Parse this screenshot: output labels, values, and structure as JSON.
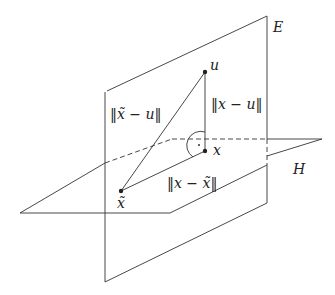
{
  "diagram": {
    "type": "geometry-projection",
    "planes": [
      {
        "id": "E",
        "label": "E"
      },
      {
        "id": "H",
        "label": "H"
      }
    ],
    "points": [
      {
        "id": "u",
        "label": "u"
      },
      {
        "id": "x",
        "label": "x"
      },
      {
        "id": "x_tilde",
        "label": "x̃"
      }
    ],
    "segments": [
      {
        "from": "x_tilde",
        "to": "u",
        "label": "‖x̃ − u‖"
      },
      {
        "from": "x",
        "to": "u",
        "label": "‖x − u‖"
      },
      {
        "from": "x",
        "to": "x_tilde",
        "label": "‖x − x̃‖"
      }
    ],
    "right_angle_at": "x",
    "stroke_color": "#333333"
  }
}
